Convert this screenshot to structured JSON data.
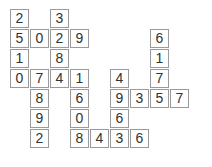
{
  "grid": {
    "columns": 9,
    "rows": 7,
    "cell_size": 19,
    "cell_pitch": 20,
    "origin_x": 10,
    "origin_y": 9,
    "colors": {
      "cell_border": "#9a9a9a",
      "cell_background": "#ffffff",
      "digit": "#333333",
      "page_background": "#ffffff"
    },
    "cells": [
      {
        "row": 0,
        "col": 0,
        "value": "2"
      },
      {
        "row": 0,
        "col": 2,
        "value": "3"
      },
      {
        "row": 1,
        "col": 0,
        "value": "5"
      },
      {
        "row": 1,
        "col": 1,
        "value": "0"
      },
      {
        "row": 1,
        "col": 2,
        "value": "2"
      },
      {
        "row": 1,
        "col": 3,
        "value": "9"
      },
      {
        "row": 1,
        "col": 7,
        "value": "6"
      },
      {
        "row": 2,
        "col": 0,
        "value": "1"
      },
      {
        "row": 2,
        "col": 2,
        "value": "8"
      },
      {
        "row": 2,
        "col": 7,
        "value": "1"
      },
      {
        "row": 3,
        "col": 0,
        "value": "0"
      },
      {
        "row": 3,
        "col": 1,
        "value": "7"
      },
      {
        "row": 3,
        "col": 2,
        "value": "4"
      },
      {
        "row": 3,
        "col": 3,
        "value": "1"
      },
      {
        "row": 3,
        "col": 5,
        "value": "4"
      },
      {
        "row": 3,
        "col": 7,
        "value": "7"
      },
      {
        "row": 4,
        "col": 1,
        "value": "8"
      },
      {
        "row": 4,
        "col": 3,
        "value": "6"
      },
      {
        "row": 4,
        "col": 5,
        "value": "9"
      },
      {
        "row": 4,
        "col": 6,
        "value": "3"
      },
      {
        "row": 4,
        "col": 7,
        "value": "5"
      },
      {
        "row": 4,
        "col": 8,
        "value": "7"
      },
      {
        "row": 5,
        "col": 1,
        "value": "9"
      },
      {
        "row": 5,
        "col": 3,
        "value": "0"
      },
      {
        "row": 5,
        "col": 5,
        "value": "6"
      },
      {
        "row": 6,
        "col": 1,
        "value": "2"
      },
      {
        "row": 6,
        "col": 3,
        "value": "8"
      },
      {
        "row": 6,
        "col": 4,
        "value": "4"
      },
      {
        "row": 6,
        "col": 5,
        "value": "3"
      },
      {
        "row": 6,
        "col": 6,
        "value": "6"
      }
    ]
  }
}
